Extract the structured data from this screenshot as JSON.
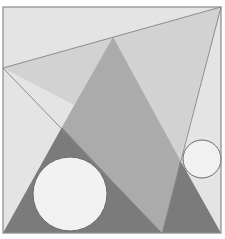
{
  "diagram": {
    "width": 225,
    "height": 239,
    "frame": {
      "x": 3,
      "y": 7,
      "width": 218,
      "height": 226,
      "fill": "#e4e4e4",
      "stroke": "#8a8a8a"
    },
    "regions": [
      {
        "name": "upper-light-triangle",
        "points": [
          [
            3,
            68
          ],
          [
            221,
            7
          ],
          [
            180,
            160
          ]
        ],
        "fill": "#d2d2d2"
      },
      {
        "name": "left-dark-triangle",
        "points": [
          [
            62,
            127
          ],
          [
            3,
            233
          ],
          [
            162,
            233
          ]
        ],
        "fill": "#7b7b7b"
      },
      {
        "name": "right-dark-triangle",
        "points": [
          [
            180,
            160
          ],
          [
            162,
            233
          ],
          [
            221,
            233
          ]
        ],
        "fill": "#7b7b7b"
      },
      {
        "name": "middle-medium-quad",
        "points": [
          [
            113,
            37
          ],
          [
            180,
            160
          ],
          [
            162,
            233
          ],
          [
            62,
            127
          ]
        ],
        "fill": "#ababab"
      }
    ],
    "lines": [
      {
        "name": "top-edge-line",
        "x1": 3,
        "y1": 68,
        "x2": 221,
        "y2": 7
      },
      {
        "name": "left-diagonal-line",
        "x1": 3,
        "y1": 68,
        "x2": 162,
        "y2": 233
      },
      {
        "name": "right-diagonal-line",
        "x1": 221,
        "y1": 7,
        "x2": 162,
        "y2": 233
      }
    ],
    "line_color": "#8c8c8c",
    "circles": [
      {
        "name": "large-circle",
        "cx": 70,
        "cy": 194,
        "r": 37,
        "fill": "#f1f1f1",
        "stroke": "#6a6a6a"
      },
      {
        "name": "small-circle",
        "cx": 202,
        "cy": 159,
        "r": 19,
        "fill": "#f1f1f1",
        "stroke": "#6a6a6a"
      }
    ]
  }
}
